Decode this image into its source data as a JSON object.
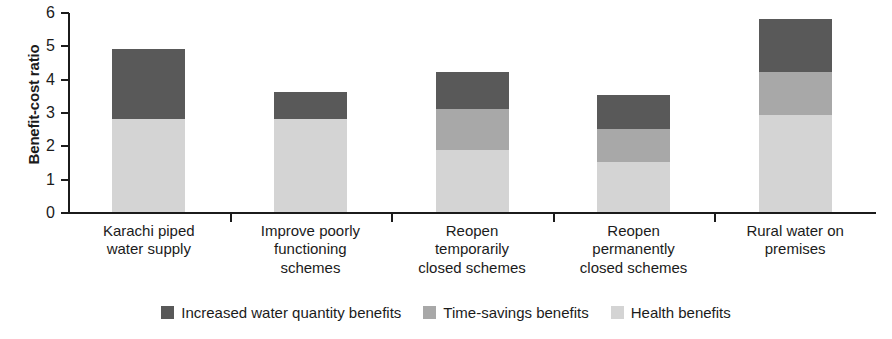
{
  "chart_data": {
    "type": "bar",
    "stacked": true,
    "title": "",
    "xlabel": "",
    "ylabel": "Benefit-cost ratio",
    "ylim": [
      0,
      6
    ],
    "ytick_labels": [
      "0",
      "1",
      "2",
      "3",
      "4",
      "5",
      "6"
    ],
    "ytick_values": [
      0,
      1,
      2,
      3,
      4,
      5,
      6
    ],
    "grid": false,
    "legend_position": "bottom",
    "categories": [
      "Karachi piped\nwater supply",
      "Improve poorly\nfunctioning\nschemes",
      "Reopen\ntemporarily\nclosed schemes",
      "Reopen\npermanently\nclosed schemes",
      "Rural water on\npremises"
    ],
    "category_lines": [
      [
        "Karachi piped",
        "water supply"
      ],
      [
        "Improve poorly",
        "functioning",
        "schemes"
      ],
      [
        "Reopen",
        "temporarily",
        "closed schemes"
      ],
      [
        "Reopen",
        "permanently",
        "closed schemes"
      ],
      [
        "Rural water on",
        "premises"
      ]
    ],
    "series": [
      {
        "name": "Health benefits",
        "color": "#d4d4d4",
        "values": [
          2.8,
          2.8,
          1.85,
          1.5,
          2.9
        ]
      },
      {
        "name": "Time-savings benefits",
        "color": "#a8a8a8",
        "values": [
          0,
          0,
          1.25,
          1.0,
          1.3
        ]
      },
      {
        "name": "Increased water quantity benefits",
        "color": "#595959",
        "values": [
          2.1,
          0.8,
          1.1,
          1.0,
          1.6
        ]
      }
    ],
    "totals": [
      4.9,
      3.6,
      4.2,
      3.5,
      5.8
    ]
  },
  "legend": {
    "items": [
      {
        "label": "Increased water quantity benefits",
        "color": "#595959"
      },
      {
        "label": "Time-savings benefits",
        "color": "#a8a8a8"
      },
      {
        "label": "Health benefits",
        "color": "#d4d4d4"
      }
    ]
  },
  "axis": {
    "y_title": "Benefit-cost ratio"
  }
}
